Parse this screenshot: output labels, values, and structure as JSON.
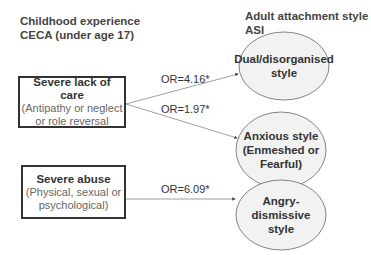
{
  "headers": {
    "left_line1": "Childhood experience",
    "left_line2": "CECA (under age 17)",
    "right_line1": "Adult attachment style",
    "right_line2": "ASI"
  },
  "sources": [
    {
      "title": "Severe lack of care",
      "subtitle_line1": "(Antipathy or neglect",
      "subtitle_line2": "or role reversal"
    },
    {
      "title": "Severe abuse",
      "subtitle_line1": "(Physical, sexual or",
      "subtitle_line2": "psychological)"
    }
  ],
  "outcomes": [
    {
      "label": "Dual/disorganised\nstyle"
    },
    {
      "label": "Anxious style\n(Enmeshed or\nFearful)"
    },
    {
      "label": "Angry-dismissive\nstyle"
    }
  ],
  "edges": [
    {
      "from": "Severe lack of care",
      "to": "Dual/disorganised style",
      "label": "OR=4.16*"
    },
    {
      "from": "Severe lack of care",
      "to": "Anxious style",
      "label": "OR=1.97*"
    },
    {
      "from": "Severe abuse",
      "to": "Angry-dismissive style",
      "label": "OR=6.09*"
    }
  ],
  "colors": {
    "ellipse_fill": "#f2f2f2",
    "stroke": "#555555",
    "box_border": "#333333"
  }
}
